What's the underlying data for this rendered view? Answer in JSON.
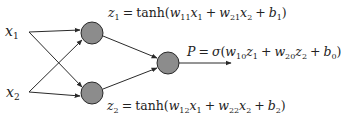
{
  "diagram": {
    "colors": {
      "node_fill": "#8c8c8c",
      "node_stroke": "#2a2a2a",
      "edge": "#2a2a2a",
      "text": "#222222",
      "background": "#ffffff"
    },
    "inputs": [
      {
        "id": "x1",
        "label": "x",
        "sub": "1"
      },
      {
        "id": "x2",
        "label": "x",
        "sub": "2"
      }
    ],
    "hidden": [
      {
        "id": "z1",
        "equation": {
          "lhs": "z",
          "lhs_sub": "1",
          "eq": "=",
          "func": "tanh",
          "w_a": "w",
          "w_a_sub": "11",
          "x_a": "x",
          "x_a_sub": "1",
          "plus1": "+",
          "w_b": "w",
          "w_b_sub": "21",
          "x_b": "x",
          "x_b_sub": "2",
          "plus2": "+",
          "bias": "b",
          "bias_sub": "1"
        }
      },
      {
        "id": "z2",
        "equation": {
          "lhs": "z",
          "lhs_sub": "2",
          "eq": "=",
          "func": "tanh",
          "w_a": "w",
          "w_a_sub": "12",
          "x_a": "x",
          "x_a_sub": "1",
          "plus1": "+",
          "w_b": "w",
          "w_b_sub": "22",
          "x_b": "x",
          "x_b_sub": "2",
          "plus2": "+",
          "bias": "b",
          "bias_sub": "2"
        }
      }
    ],
    "output": {
      "id": "P",
      "equation": {
        "lhs": "P",
        "eq": "=",
        "func": "σ",
        "w_a": "w",
        "w_a_sub": "10",
        "z_a": "z",
        "z_a_sub": "1",
        "plus1": "+",
        "w_b": "w",
        "w_b_sub": "20",
        "z_b": "z",
        "z_b_sub": "2",
        "plus2": "+",
        "bias": "b",
        "bias_sub": "0"
      }
    },
    "edges": [
      {
        "from": "x1",
        "to": "z1"
      },
      {
        "from": "x1",
        "to": "z2"
      },
      {
        "from": "x2",
        "to": "z1"
      },
      {
        "from": "x2",
        "to": "z2"
      },
      {
        "from": "z1",
        "to": "P"
      },
      {
        "from": "z2",
        "to": "P"
      },
      {
        "from": "P",
        "to": "out"
      }
    ],
    "paren_open": "(",
    "paren_close": ")"
  }
}
